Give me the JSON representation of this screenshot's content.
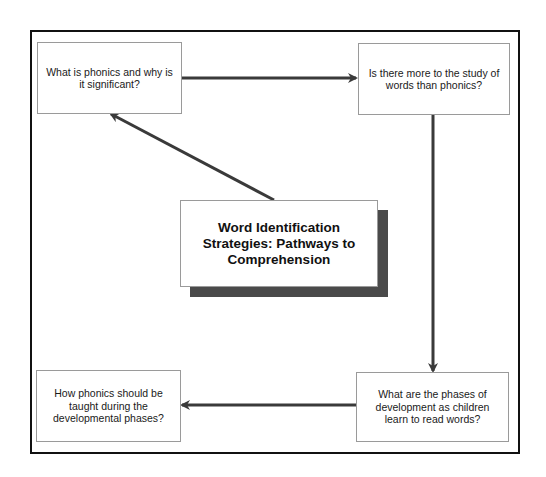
{
  "diagram": {
    "center_title": "Word Identification Strategies: Pathways to Comprehension",
    "nodes": [
      {
        "id": "top-left",
        "text": "What is phonics and why is it significant?"
      },
      {
        "id": "top-right",
        "text": "Is there more to the study of words than phonics?"
      },
      {
        "id": "bottom-right",
        "text": "What are the phases of development as children learn to read words?"
      },
      {
        "id": "bottom-left",
        "text": "How phonics should be taught during the developmental phases?"
      }
    ],
    "edges": [
      {
        "from": "top-left",
        "to": "top-right"
      },
      {
        "from": "top-right",
        "to": "bottom-right"
      },
      {
        "from": "bottom-right",
        "to": "bottom-left"
      },
      {
        "from": "center",
        "to": "top-left"
      }
    ],
    "colors": {
      "frame": "#111111",
      "arrow": "#3a3a3a",
      "shadow": "#4a4a4a",
      "node_border": "#9a9a9a"
    }
  }
}
